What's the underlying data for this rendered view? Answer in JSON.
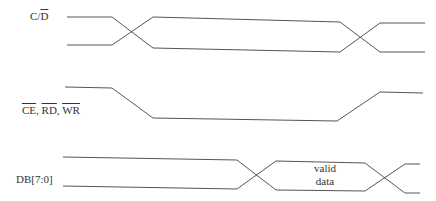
{
  "diagram": {
    "type": "timing-diagram",
    "signals": [
      {
        "id": "cd",
        "label_plain": "C/",
        "label_overline": "D",
        "kind": "bus-transition"
      },
      {
        "id": "ce_rd_wr",
        "labels": [
          {
            "text": "CE",
            "overline": true
          },
          {
            "sep": ", "
          },
          {
            "text": "RD",
            "overline": true
          },
          {
            "sep": ", "
          },
          {
            "text": "WR",
            "overline": true
          }
        ],
        "kind": "active-low-pulse"
      },
      {
        "id": "db",
        "label": "DB[7:0]",
        "kind": "bus-valid-window",
        "valid_label_line1": "valid",
        "valid_label_line2": "data"
      }
    ],
    "labels": {
      "cd_prefix": "C/",
      "cd_overline": "D",
      "ce": "CE",
      "rd": "RD",
      "wr": "WR",
      "sep": ", ",
      "db": "DB[7:0]",
      "valid": "valid",
      "data": "data"
    },
    "colors": {
      "line": "#555555",
      "text": "#333333",
      "background": "#ffffff"
    }
  }
}
